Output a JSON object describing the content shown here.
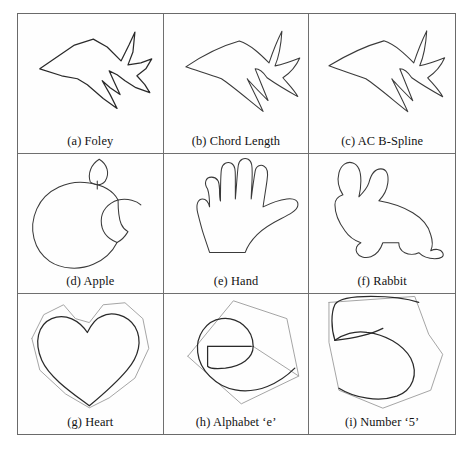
{
  "figure": {
    "columns": 3,
    "rows": 3,
    "border_color": "#6a6a6a",
    "curve_color": "#2a2a2a",
    "control_polygon_color": "#9a9a9a",
    "background": "#ffffff",
    "cells": [
      {
        "id": "cell-a",
        "caption": "(a) Foley",
        "shape": "fish",
        "shape_name": "fish-outline",
        "has_control_polygon": false,
        "style": "angular"
      },
      {
        "id": "cell-b",
        "caption": "(b) Chord Length",
        "shape": "fish",
        "shape_name": "fish-outline",
        "has_control_polygon": false,
        "style": "smooth"
      },
      {
        "id": "cell-c",
        "caption": "(c) AC B-Spline",
        "shape": "fish",
        "shape_name": "fish-outline",
        "has_control_polygon": false,
        "style": "smooth"
      },
      {
        "id": "cell-d",
        "caption": "(d) Apple",
        "shape": "apple",
        "shape_name": "apple-logo-outline",
        "has_control_polygon": false,
        "style": "smooth"
      },
      {
        "id": "cell-e",
        "caption": "(e) Hand",
        "shape": "hand",
        "shape_name": "hand-outline",
        "has_control_polygon": false,
        "style": "smooth"
      },
      {
        "id": "cell-f",
        "caption": "(f) Rabbit",
        "shape": "rabbit",
        "shape_name": "rabbit-outline",
        "has_control_polygon": false,
        "style": "smooth"
      },
      {
        "id": "cell-g",
        "caption": "(g) Heart",
        "shape": "heart",
        "shape_name": "heart-outline",
        "has_control_polygon": true,
        "style": "smooth"
      },
      {
        "id": "cell-h",
        "caption": "(h) Alphabet ‘e’",
        "shape": "letter-e",
        "shape_name": "letter-e-outline",
        "has_control_polygon": true,
        "style": "smooth"
      },
      {
        "id": "cell-i",
        "caption": "(i) Number ‘5’",
        "shape": "number-5",
        "shape_name": "number-5-outline",
        "has_control_polygon": true,
        "style": "smooth"
      }
    ]
  }
}
